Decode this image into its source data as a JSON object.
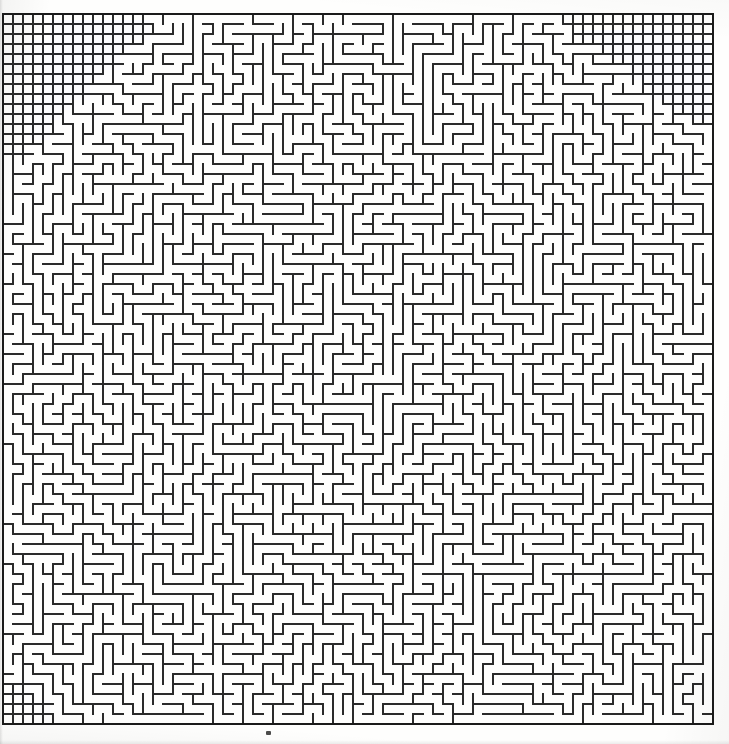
{
  "document": {
    "kind": "maze-puzzle-scan",
    "title": "Square Maze",
    "canvas_width": 729,
    "canvas_height": 744,
    "background_color": "#fefefd",
    "ink_color": "#1f1f1f",
    "wall_color": "#2a2a2a",
    "border_color": "#1a1a1a"
  },
  "maze": {
    "origin_x": 3,
    "origin_y": 14,
    "cell_size": 10,
    "cols": 71,
    "rows": 71,
    "wall_thickness": 1.5,
    "border_thickness": 2.0,
    "random_seed": 20240517,
    "entrance": {
      "side": "top",
      "cell_index": 0,
      "present": false
    },
    "exit": {
      "side": "bottom",
      "cell_index": 70,
      "present": false
    },
    "dense_regions": [
      {
        "name": "top-left-grid",
        "label": "dense full-grid triangular block, upper left",
        "corner": "top-left",
        "col_start": 0,
        "row_start": 0,
        "col_span": 14,
        "row_span": 14,
        "shape": "staircase-triangle"
      },
      {
        "name": "top-right-grid",
        "label": "dense full-grid triangular block, upper right",
        "corner": "top-right",
        "col_start": 57,
        "row_start": 0,
        "col_span": 14,
        "row_span": 11,
        "shape": "staircase-triangle"
      },
      {
        "name": "bottom-left-grid",
        "label": "dense full-grid triangular block, lower left",
        "corner": "bottom-left",
        "col_start": 0,
        "row_start": 67,
        "col_span": 5,
        "row_span": 5,
        "shape": "staircase-triangle"
      }
    ]
  },
  "artifacts": {
    "stray_marks": [
      {
        "name": "ink-speck-bottom",
        "x": 266,
        "y": 731,
        "width": 5,
        "height": 4
      }
    ]
  },
  "chart_data": {
    "type": "table",
    "note": "Rectangular perfect maze, 71 x 71 cells at 10 px pitch; three corner blocks drawn as fully-walled dense grids.",
    "categories": [
      "cols",
      "rows",
      "cell_size_px",
      "dense_corner_blocks"
    ],
    "values": [
      71,
      71,
      10,
      3
    ]
  }
}
